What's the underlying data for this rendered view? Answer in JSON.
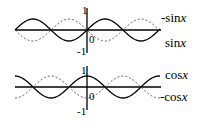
{
  "plots": [
    {
      "name": "sine-plot",
      "y_ticks": {
        "top": "1",
        "bottom": "-1",
        "origin": "0"
      },
      "curves": [
        {
          "label_prefix": "-sin",
          "label_var": "x",
          "style": "dashed"
        },
        {
          "label_prefix": "sin",
          "label_var": "x",
          "style": "solid"
        }
      ]
    },
    {
      "name": "cosine-plot",
      "y_ticks": {
        "top": "1",
        "bottom": "-1",
        "origin": "0"
      },
      "curves": [
        {
          "label_prefix": "cos",
          "label_var": "x",
          "style": "solid"
        },
        {
          "label_prefix": "-cos",
          "label_var": "x",
          "style": "dashed"
        }
      ]
    }
  ]
}
